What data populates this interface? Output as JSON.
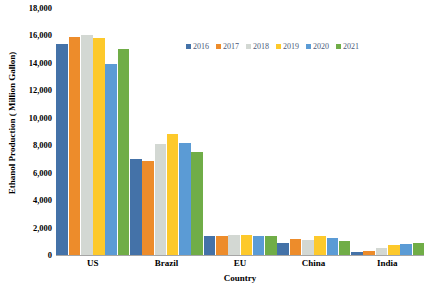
{
  "chart_data": {
    "type": "bar",
    "title": "",
    "xlabel": "Country",
    "ylabel": "Ethanol Production ( Million Gallon)",
    "categories": [
      "US",
      "Brazil",
      "EU",
      "China",
      "India"
    ],
    "ylim": [
      0,
      18000
    ],
    "yticks": [
      "0",
      "2,000",
      "4,000",
      "6,000",
      "8,000",
      "10,000",
      "12,000",
      "14,000",
      "16,000",
      "18,000"
    ],
    "ytick_values": [
      0,
      2000,
      4000,
      6000,
      8000,
      10000,
      12000,
      14000,
      16000,
      18000
    ],
    "grid": false,
    "legend_position": "top-center",
    "series": [
      {
        "name": "2016",
        "color": "#4472a8",
        "values": [
          15400,
          7000,
          1350,
          850,
          250
        ]
      },
      {
        "name": "2017",
        "color": "#ed8c2b",
        "values": [
          15900,
          6850,
          1400,
          1150,
          300
        ]
      },
      {
        "name": "2018",
        "color": "#d3d8d3",
        "values": [
          16050,
          8100,
          1450,
          1100,
          500
        ]
      },
      {
        "name": "2019",
        "color": "#fdc92b",
        "values": [
          15800,
          8800,
          1450,
          1350,
          750
        ]
      },
      {
        "name": "2020",
        "color": "#5b9bd5",
        "values": [
          13950,
          8150,
          1350,
          1250,
          800
        ]
      },
      {
        "name": "2021",
        "color": "#70ad47",
        "values": [
          15000,
          7500,
          1400,
          1050,
          900
        ]
      }
    ]
  }
}
